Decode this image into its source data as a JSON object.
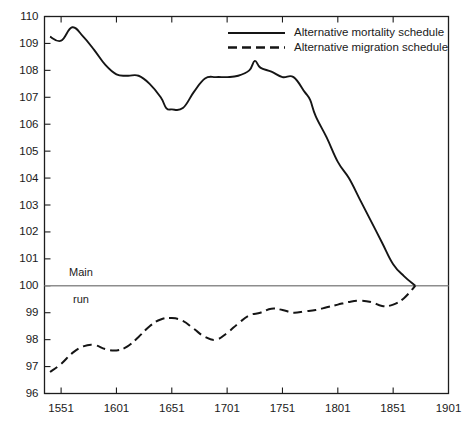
{
  "chart_data": {
    "type": "line",
    "title": "",
    "subtitle": "",
    "xlabel": "",
    "ylabel": "",
    "xlim": [
      1536,
      1901
    ],
    "ylim": [
      96,
      110
    ],
    "grid": false,
    "legend_position": "top-right-inside",
    "x_ticks": [
      "1551",
      "1601",
      "1651",
      "1701",
      "1751",
      "1801",
      "1851",
      "1901"
    ],
    "x_tick_values": [
      1551,
      1601,
      1651,
      1701,
      1751,
      1801,
      1851,
      1901
    ],
    "y_ticks": [
      "96",
      "97",
      "98",
      "99",
      "100",
      "101",
      "102",
      "103",
      "104",
      "105",
      "106",
      "107",
      "108",
      "109",
      "110"
    ],
    "y_tick_values": [
      96,
      97,
      98,
      99,
      100,
      101,
      102,
      103,
      104,
      105,
      106,
      107,
      108,
      109,
      110
    ],
    "annotations": [
      {
        "name": "baseline-label-top",
        "text": "Main",
        "x": 1569,
        "y": 100.28
      },
      {
        "name": "baseline-label-bottom",
        "text": "run",
        "x": 1569,
        "y": 99.72
      }
    ],
    "reference_lines": [
      {
        "name": "main-run",
        "orientation": "horizontal",
        "value": 100,
        "label": "Main run",
        "color": "#8d8d8d"
      }
    ],
    "series": [
      {
        "name": "Alternative mortality schedule",
        "style": "solid",
        "color": "#151515",
        "x": [
          1541,
          1551,
          1561,
          1571,
          1581,
          1591,
          1601,
          1611,
          1621,
          1631,
          1641,
          1646,
          1651,
          1661,
          1671,
          1681,
          1691,
          1701,
          1711,
          1721,
          1726,
          1731,
          1741,
          1751,
          1761,
          1771,
          1776,
          1781,
          1791,
          1801,
          1811,
          1821,
          1831,
          1841,
          1851,
          1861,
          1871
        ],
        "y": [
          109.25,
          109.1,
          109.6,
          109.25,
          108.75,
          108.2,
          107.85,
          107.8,
          107.8,
          107.5,
          107.0,
          106.6,
          106.55,
          106.6,
          107.2,
          107.7,
          107.75,
          107.75,
          107.8,
          108.0,
          108.35,
          108.1,
          107.95,
          107.75,
          107.75,
          107.2,
          106.9,
          106.3,
          105.5,
          104.6,
          104.0,
          103.2,
          102.4,
          101.6,
          100.8,
          100.35,
          100.0
        ]
      },
      {
        "name": "Alternative migration schedule",
        "style": "dashed",
        "color": "#151515",
        "x": [
          1541,
          1551,
          1561,
          1571,
          1581,
          1591,
          1601,
          1611,
          1621,
          1631,
          1641,
          1651,
          1661,
          1671,
          1681,
          1691,
          1701,
          1711,
          1721,
          1731,
          1741,
          1751,
          1761,
          1771,
          1781,
          1791,
          1801,
          1811,
          1821,
          1831,
          1841,
          1851,
          1861,
          1871
        ],
        "y": [
          96.8,
          97.1,
          97.5,
          97.75,
          97.8,
          97.65,
          97.6,
          97.75,
          98.1,
          98.5,
          98.75,
          98.8,
          98.7,
          98.4,
          98.1,
          98.0,
          98.25,
          98.6,
          98.9,
          99.0,
          99.15,
          99.1,
          99.0,
          99.05,
          99.1,
          99.2,
          99.3,
          99.4,
          99.45,
          99.4,
          99.25,
          99.3,
          99.55,
          100.0
        ]
      }
    ],
    "legend": [
      {
        "label": "Alternative mortality schedule",
        "style": "solid"
      },
      {
        "label": "Alternative migration schedule",
        "style": "dashed"
      }
    ]
  }
}
